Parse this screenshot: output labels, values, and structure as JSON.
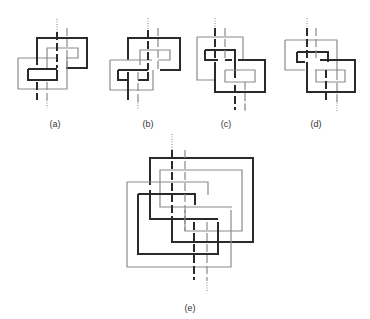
{
  "figure": {
    "colors": {
      "dark": "#2a2a2a",
      "light": "#8a8a8a",
      "dotted": "#9a9a9a"
    },
    "panels": [
      {
        "id": "a",
        "label": "(a)",
        "label_x": 55,
        "label_y": 119,
        "paths": [
          {
            "c": "light",
            "d": "M18 58 H58 M18 58 V89 H67 V58"
          },
          {
            "c": "dark",
            "d": "M37 65 V38 H87 V68 H66"
          },
          {
            "c": "light",
            "d": "M47 70 V48 H78 V58 H66"
          },
          {
            "c": "dark",
            "d": "M28 69 H57 M28 69 V80 H57 V70"
          },
          {
            "c": "dark",
            "d": "M57 32 V68",
            "dash": "8 3"
          },
          {
            "c": "light",
            "d": "M67 28 V70",
            "dash": "8 3"
          },
          {
            "c": "dark",
            "d": "M37 82 V100",
            "dash": "8 3"
          },
          {
            "c": "light",
            "d": "M47 82 V100",
            "dash": "8 3"
          }
        ],
        "dotted": [
          {
            "x": 57,
            "y1": 19,
            "y2": 32
          },
          {
            "x": 47,
            "y1": 100,
            "y2": 108
          }
        ]
      },
      {
        "id": "b",
        "label": "(b)",
        "label_x": 148,
        "label_y": 119,
        "paths": [
          {
            "c": "dark",
            "d": "M128 60 V38 H180 V70 H160"
          },
          {
            "c": "light",
            "d": "M140 65 V50 H170 V60 H158"
          },
          {
            "c": "light",
            "d": "M110 60 H152 M110 60 V90 H153 V70"
          },
          {
            "c": "dark",
            "d": "M118 70 H148 M118 70 V80 H128 M138 80 H148 V72"
          },
          {
            "c": "dark",
            "d": "M148 30 V70",
            "dash": "8 3"
          },
          {
            "c": "light",
            "d": "M158 28 V70",
            "dash": "8 3"
          },
          {
            "c": "dark",
            "d": "M128 72 V100"
          },
          {
            "c": "light",
            "d": "M138 72 V103",
            "dash": "8 3"
          }
        ],
        "dotted": [
          {
            "x": 148,
            "y1": 18,
            "y2": 30
          },
          {
            "x": 138,
            "y1": 100,
            "y2": 110
          }
        ]
      },
      {
        "id": "c",
        "label": "(c)",
        "label_x": 226,
        "label_y": 119,
        "paths": [
          {
            "c": "light",
            "d": "M197 37 H243 V60 M197 37 V80 H215"
          },
          {
            "c": "dark",
            "d": "M205 50 H235 V78 M205 50 V60 H218 M225 60 H232"
          },
          {
            "c": "light",
            "d": "M225 70 H255 V82 H225 V70"
          },
          {
            "c": "dark",
            "d": "M238 60 H265 V92 H215 V62"
          },
          {
            "c": "dark",
            "d": "M215 28 V60",
            "dash": "8 3"
          },
          {
            "c": "light",
            "d": "M225 28 V60",
            "dash": "8 3"
          },
          {
            "c": "dark",
            "d": "M235 85 V110",
            "dash": "8 3"
          },
          {
            "c": "light",
            "d": "M245 82 V110",
            "dash": "8 3"
          }
        ],
        "dotted": [
          {
            "x": 215,
            "y1": 18,
            "y2": 28
          },
          {
            "x": 245,
            "y1": 100,
            "y2": 112
          }
        ]
      },
      {
        "id": "d",
        "label": "(d)",
        "label_x": 316,
        "label_y": 119,
        "paths": [
          {
            "c": "light",
            "d": "M285 40 H337 V72 M285 40 V70 H305"
          },
          {
            "c": "dark",
            "d": "M297 52 H328 V62 M297 52 V62 H305"
          },
          {
            "c": "dark",
            "d": "M320 60 H355 V92 H307 V62"
          },
          {
            "c": "light",
            "d": "M315 70 H345 V82 H316 V70"
          },
          {
            "c": "dark",
            "d": "M307 28 V60",
            "dash": "8 3"
          },
          {
            "c": "light",
            "d": "M316 28 V60",
            "dash": "8 3"
          },
          {
            "c": "dark",
            "d": "M326 70 V102",
            "dash": "8 3"
          },
          {
            "c": "light",
            "d": "M337 72 V102",
            "dash": "8 3"
          }
        ],
        "dotted": [
          {
            "x": 307,
            "y1": 18,
            "y2": 28
          },
          {
            "x": 337,
            "y1": 100,
            "y2": 112
          }
        ]
      },
      {
        "id": "e",
        "label": "(e)",
        "label_x": 190,
        "label_y": 303,
        "paths": [
          {
            "c": "dark",
            "d": "M150 185 V158 H253 V242 H172 V222"
          },
          {
            "c": "light",
            "d": "M160 200 V170 H242 V231 H185 V210"
          },
          {
            "c": "light",
            "d": "M127 182 H208 V195 M127 182 V267 H231 V210"
          },
          {
            "c": "dark",
            "d": "M138 194 H195 V205 M138 194 V254 H218 V222"
          },
          {
            "c": "light",
            "d": "M160 200 V207 H232"
          },
          {
            "c": "dark",
            "d": "M150 190 V219 H218"
          },
          {
            "c": "dark",
            "d": "M172 150 V242",
            "dash": "8 3"
          },
          {
            "c": "light",
            "d": "M185 150 V231",
            "dash": "8 3"
          },
          {
            "c": "dark",
            "d": "M194 222 V280",
            "dash": "8 3"
          },
          {
            "c": "light",
            "d": "M207 222 V280",
            "dash": "8 3"
          }
        ],
        "dotted": [
          {
            "x": 172,
            "y1": 134,
            "y2": 150
          },
          {
            "x": 207,
            "y1": 280,
            "y2": 292
          }
        ]
      }
    ]
  }
}
